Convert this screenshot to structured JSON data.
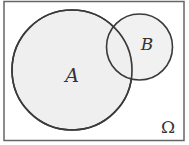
{
  "diagram": {
    "type": "venn",
    "universe_label": "Ω",
    "sets": [
      {
        "label": "A"
      },
      {
        "label": "B"
      }
    ],
    "colors": {
      "fill": "#efefef",
      "stroke": "#3a3a3a",
      "frame": "#555555",
      "background": "#ffffff"
    }
  }
}
